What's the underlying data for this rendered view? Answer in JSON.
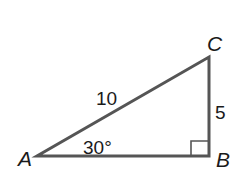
{
  "diagram": {
    "type": "right-triangle",
    "colors": {
      "stroke": "#555555",
      "text": "#1a1a1a",
      "background": "#ffffff"
    },
    "vertices": {
      "A": {
        "label": "A"
      },
      "B": {
        "label": "B",
        "right_angle": true
      },
      "C": {
        "label": "C"
      }
    },
    "sides": {
      "hypotenuse_AC": {
        "label": "10"
      },
      "leg_BC": {
        "label": "5"
      },
      "leg_AB": {
        "label": ""
      }
    },
    "angles": {
      "A": {
        "label": "30°"
      }
    }
  }
}
